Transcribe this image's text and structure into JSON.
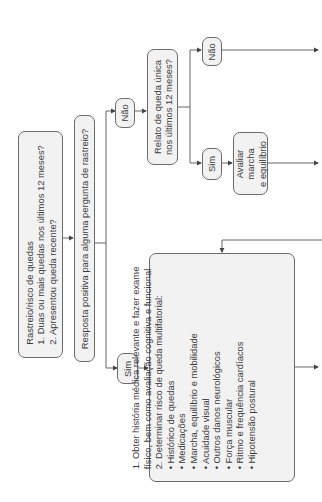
{
  "flowchart": {
    "screening_box": {
      "title": "Rastreio/risco de quedas",
      "line1": "1. Duas ou mais quedas nos últimos 12 meses?",
      "line2": "2. Apresentou queda recente?"
    },
    "positive_question": "Resposta positiva para alguma pergunta de rastreio?",
    "no_label_1": "Não",
    "yes_label_1": "Sim",
    "single_fall_question": {
      "line1": "Relato de queda única",
      "line2": "nos últimos 12 meses?"
    },
    "no_label_2": "Não",
    "yes_label_2": "Sim",
    "gait_box": {
      "line1": "Avaliar",
      "line2": "marcha",
      "line3": "e equilíbrio"
    },
    "assessment_box": {
      "line1": "1. Obter história médica relevante e fazer exame",
      "line2": "físico, bem como avaliação cognitiva e funcional",
      "line3": "2. Determinar risco de queda multifatorial:",
      "items": [
        "Histórico de quedas",
        "Medicações",
        "Marcha, equilíbrio e mobilidade",
        "Acuidade visual",
        "Outros danos neurológicos",
        "Força muscular",
        "Ritmo e frequência cardíacos",
        "Hipotensão postural"
      ]
    }
  },
  "colors": {
    "line": "#555555",
    "box_fill": "#f2f2f2",
    "box_border": "#6b6b6b"
  }
}
